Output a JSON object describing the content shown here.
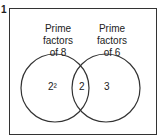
{
  "question": {
    "number": "1"
  },
  "venn": {
    "left": {
      "title_line1": "Prime factors",
      "title_line2": "of 8",
      "only": "2²"
    },
    "right": {
      "title_line1": "Prime factors",
      "title_line2": "of 6",
      "only": "3"
    },
    "intersection": "2"
  }
}
